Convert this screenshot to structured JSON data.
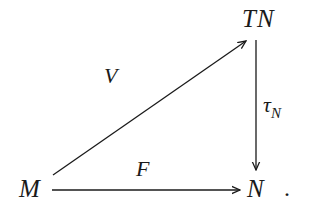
{
  "diagram": {
    "type": "commutative-diagram",
    "nodes": {
      "tn": {
        "label": "TN"
      },
      "m": {
        "label": "M"
      },
      "n": {
        "label": "N"
      }
    },
    "arrows": {
      "v": {
        "label": "V",
        "from": "M",
        "to": "TN"
      },
      "tau": {
        "label": "τ",
        "subscript": "N",
        "from": "TN",
        "to": "N"
      },
      "f": {
        "label": "F",
        "from": "M",
        "to": "N"
      }
    },
    "trailing_punctuation": ".",
    "colors": {
      "ink": "#1a1a1a",
      "background": "#ffffff"
    }
  }
}
